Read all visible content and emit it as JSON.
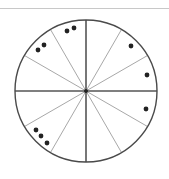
{
  "diagram": {
    "type": "sector-wheel",
    "sector_count": 12,
    "center": [
      86,
      91
    ],
    "radius": 71,
    "colors": {
      "outline": "#4a4a4a",
      "main_axes": "#555555",
      "spokes": "#a8a8a8",
      "dots": "#222222",
      "top_rule": "#c8c8c8"
    },
    "spoke_angles_deg": [
      0,
      30,
      60,
      90,
      120,
      150,
      180,
      210,
      240,
      270,
      300,
      330
    ],
    "main_axis_angles_deg": [
      0,
      90,
      180,
      270
    ],
    "dots": [
      {
        "sector": "upper-left-near-top",
        "points": [
          [
            67,
            31
          ],
          [
            74,
            28
          ]
        ]
      },
      {
        "sector": "upper-left",
        "points": [
          [
            38,
            50
          ],
          [
            44,
            45
          ]
        ]
      },
      {
        "sector": "upper-right",
        "points": [
          [
            131,
            46
          ]
        ]
      },
      {
        "sector": "right-upper",
        "points": [
          [
            147,
            75
          ]
        ]
      },
      {
        "sector": "right-lower",
        "points": [
          [
            146,
            109
          ]
        ]
      },
      {
        "sector": "lower-left",
        "points": [
          [
            36,
            130
          ],
          [
            41,
            136
          ],
          [
            47,
            143
          ]
        ]
      }
    ],
    "dot_count_total": 11
  }
}
